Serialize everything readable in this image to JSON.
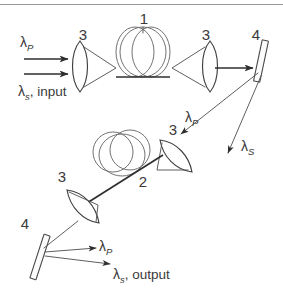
{
  "figure": {
    "background_color": "#ffffff",
    "ink_color": "#3f3f3f",
    "top_rule": true
  },
  "labels": {
    "component_1": "1",
    "component_2": "2",
    "lens_top_left": "3",
    "lens_top_right": "3",
    "lens_mid": "3",
    "lens_lower": "3",
    "mirror_right": "4",
    "mirror_lower_left": "4",
    "lambda_p_input": "λ",
    "lambda_p_input_sub": "P",
    "lambda_s_input": "λ",
    "lambda_s_input_sub": "s",
    "lambda_s_input_rest": ", input",
    "lambda_p_mid": "λ",
    "lambda_p_mid_sub": "P",
    "lambda_s_right": "λ",
    "lambda_s_right_sub": "S",
    "lambda_p_out": "λ",
    "lambda_p_out_sub": "P",
    "lambda_s_out": "λ",
    "lambda_s_out_sub": "s",
    "lambda_s_out_rest": ", output"
  },
  "components": [
    {
      "id": "1",
      "name": "fiber-coil-upper",
      "type": "optical-fiber-coil"
    },
    {
      "id": "2",
      "name": "fiber-coil-lower",
      "type": "optical-fiber-coil"
    },
    {
      "id": "3",
      "name": "lens",
      "type": "converging-lens",
      "count": 4
    },
    {
      "id": "4",
      "name": "mirror",
      "type": "tilted-mirror",
      "count": 2
    }
  ],
  "beams": [
    {
      "name": "pump-input",
      "label": "λP",
      "direction": "rightward"
    },
    {
      "name": "signal-input",
      "label": "λs",
      "direction": "rightward"
    },
    {
      "name": "pump-return",
      "label": "λP",
      "direction": "down-left"
    },
    {
      "name": "signal-return",
      "label": "λS",
      "direction": "down-left"
    },
    {
      "name": "pump-output",
      "label": "λP",
      "direction": "rightward"
    },
    {
      "name": "signal-output",
      "label": "λs",
      "direction": "rightward"
    }
  ]
}
